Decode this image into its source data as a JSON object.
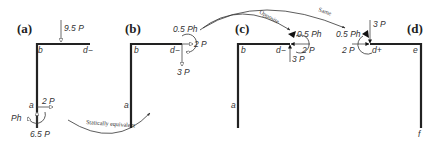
{
  "panels": [
    {
      "id": "a",
      "label": "(a)",
      "nodes": {
        "b": "b",
        "d": "d−",
        "a": "a"
      },
      "loads": {
        "top_load": "9.5 P",
        "horiz": "2 P",
        "moment": "Ph",
        "vertical": "6.5 P"
      }
    },
    {
      "id": "b",
      "label": "(b)",
      "nodes": {
        "b": "b",
        "d": "d−",
        "a": "a"
      },
      "loads": {
        "moment": "0.5 Ph",
        "horiz": "2 P",
        "vertical": "3 P"
      }
    },
    {
      "id": "c",
      "label": "(c)",
      "nodes": {
        "b": "b",
        "d": "d−",
        "a": "a"
      },
      "loads": {
        "moment": "0.5 Ph",
        "horiz": "2 P",
        "vertical": "3 P"
      }
    },
    {
      "id": "d",
      "label": "(d)",
      "nodes": {
        "d": "d+",
        "e": "e",
        "f": "f"
      },
      "loads": {
        "moment": "0.5 Ph",
        "horiz": "2 P",
        "vertical": "3 P"
      }
    }
  ],
  "annotations": {
    "statically_equivalent": "Statically equivalent",
    "opposite": "Opposite",
    "same": "Same"
  }
}
